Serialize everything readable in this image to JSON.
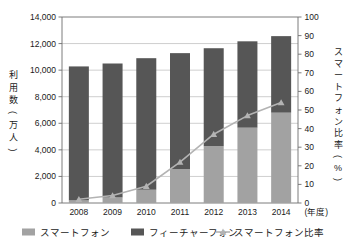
{
  "chart_data": {
    "type": "bar",
    "subtype": "stacked-bar-with-line",
    "title": "",
    "categories": [
      "2008",
      "2009",
      "2010",
      "2011",
      "2012",
      "2013",
      "2014"
    ],
    "xlabel": "(年度)",
    "ylabel": "利用数\n(万人)",
    "y2label": "スマートフォン比率\n(%)",
    "ylim": [
      0,
      14000
    ],
    "y2lim": [
      0,
      100
    ],
    "yticks": [
      "0",
      "2,000",
      "4,000",
      "6,000",
      "8,000",
      "10,000",
      "12,000",
      "14,000"
    ],
    "ytick_values": [
      0,
      2000,
      4000,
      6000,
      8000,
      10000,
      12000,
      14000
    ],
    "y2ticks": [
      "0",
      "10",
      "20",
      "30",
      "40",
      "50",
      "60",
      "70",
      "80",
      "90",
      "100"
    ],
    "y2tick_values": [
      0,
      10,
      20,
      30,
      40,
      50,
      60,
      70,
      80,
      90,
      100
    ],
    "grid": true,
    "legend_position": "bottom",
    "series": [
      {
        "name": "スマートフォン",
        "type": "bar",
        "axis": "left",
        "color": "#a2a2a2",
        "values": [
          200,
          420,
          1000,
          2550,
          4280,
          5670,
          6800
        ]
      },
      {
        "name": "フィーチャーフォン",
        "type": "bar",
        "axis": "left",
        "color": "#565656",
        "values": [
          10080,
          10080,
          9900,
          8730,
          7370,
          6500,
          5760
        ]
      },
      {
        "name": "スマートフォン比率",
        "type": "line",
        "axis": "right",
        "color": "#b3b3b3",
        "marker": "triangle",
        "values": [
          2,
          4,
          9,
          22,
          37,
          47,
          54
        ]
      }
    ],
    "totals": [
      10280,
      10500,
      10900,
      11280,
      11650,
      12170,
      12560
    ]
  },
  "axis": {
    "left_title_chars": [
      "利",
      "用",
      "数",
      "(",
      "万",
      "人",
      ")"
    ],
    "right_title_chars": [
      "ス",
      "マ",
      "ー",
      "ト",
      "フ",
      "ォ",
      "ン",
      "比",
      "率",
      "(",
      "%",
      ")"
    ],
    "x_unit": "(年度)"
  },
  "legend": {
    "items": [
      {
        "label": "スマートフォン",
        "marker": "square",
        "color": "#a2a2a2"
      },
      {
        "label": "フィーチャーフォン",
        "marker": "square",
        "color": "#565656"
      },
      {
        "label": "スマートフォン比率",
        "marker": "line-triangle",
        "color": "#b3b3b3"
      }
    ]
  },
  "colors": {
    "smartphone": "#a2a2a2",
    "feature_phone": "#565656",
    "ratio_line": "#b3b3b3",
    "grid": "#b9b9b9",
    "frame": "#6e6e6e",
    "text": "#1a1a1a",
    "background": "#ffffff"
  }
}
